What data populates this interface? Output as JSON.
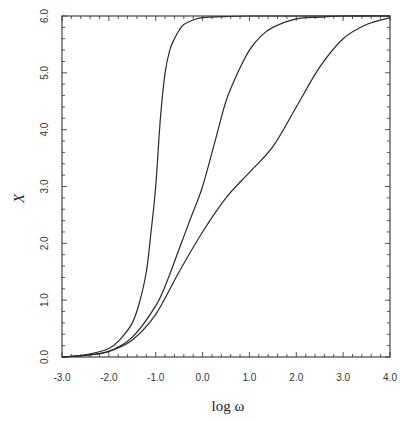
{
  "chart_data": {
    "type": "line",
    "title": "",
    "xlabel": "log ω",
    "ylabel": "X",
    "xlim": [
      -3.0,
      4.0
    ],
    "ylim": [
      0.0,
      6.0
    ],
    "x_ticks": [
      "-3.0",
      "-2.0",
      "-1.0",
      "0.0",
      "1.0",
      "2.0",
      "3.0",
      "4.0"
    ],
    "y_ticks": [
      "0.0",
      "1.0",
      "2.0",
      "3.0",
      "4.0",
      "5.0",
      "6.0"
    ],
    "grid": false,
    "legend": null,
    "series": [
      {
        "name": "curve-1",
        "x": [
          -3.0,
          -2.5,
          -2.0,
          -1.75,
          -1.5,
          -1.35,
          -1.2,
          -1.1,
          -1.0,
          -0.9,
          -0.8,
          -0.7,
          -0.6,
          -0.5,
          -0.4,
          -0.2,
          0.0,
          0.5,
          1.0,
          2.0,
          4.0
        ],
        "y": [
          0.0,
          0.04,
          0.15,
          0.32,
          0.6,
          0.95,
          1.5,
          2.2,
          3.0,
          4.2,
          5.0,
          5.4,
          5.6,
          5.75,
          5.85,
          5.93,
          5.97,
          5.99,
          6.0,
          6.0,
          6.0
        ]
      },
      {
        "name": "curve-2",
        "x": [
          -3.0,
          -2.5,
          -2.0,
          -1.5,
          -1.0,
          -0.75,
          -0.5,
          -0.25,
          0.0,
          0.3,
          0.5,
          0.75,
          1.0,
          1.25,
          1.5,
          2.0,
          2.5,
          3.0,
          4.0
        ],
        "y": [
          0.0,
          0.03,
          0.1,
          0.35,
          0.9,
          1.35,
          1.9,
          2.45,
          3.0,
          3.9,
          4.5,
          5.0,
          5.4,
          5.65,
          5.8,
          5.95,
          5.98,
          6.0,
          6.0
        ]
      },
      {
        "name": "curve-3",
        "x": [
          -3.0,
          -2.5,
          -2.0,
          -1.5,
          -1.0,
          -0.5,
          0.0,
          0.5,
          1.0,
          1.5,
          2.0,
          2.5,
          3.0,
          3.5,
          4.0
        ],
        "y": [
          0.0,
          0.03,
          0.1,
          0.3,
          0.75,
          1.5,
          2.2,
          2.8,
          3.25,
          3.7,
          4.4,
          5.1,
          5.6,
          5.85,
          5.97
        ]
      }
    ]
  },
  "plot": {
    "left": 62,
    "top": 16,
    "right": 390,
    "bottom": 357,
    "line_color": "#2a2a2a"
  }
}
